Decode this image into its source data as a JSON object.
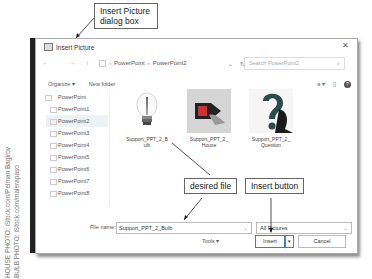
{
  "callouts": {
    "dialog": "Insert Picture dialog box",
    "desired_file": "desired file",
    "insert_button": "Insert button"
  },
  "credits": {
    "house": "HOUSE PHOTO: iStock.com/Pelman Bagirov",
    "bulb": "BULB PHOTO: iStock.com/malerapaso"
  },
  "dialog": {
    "title": "Insert Picture",
    "close": "✕",
    "nav": {
      "back": "←",
      "forward": "→",
      "up": "↑",
      "breadcrumb": [
        "PowerPoint",
        "PowerPoint2"
      ],
      "separator": "›",
      "refresh": "↻",
      "search_placeholder": "Search PowerPoint2",
      "search_icon": "⌕"
    },
    "toolbar": {
      "organize": "Organize ▾",
      "new_folder": "New folder",
      "view": "≡ ▾",
      "pane": "▯",
      "help": "?"
    },
    "sidebar": {
      "parent": "PowerPoint",
      "items": [
        "PowerPoint1",
        "PowerPoint2",
        "PowerPoint3",
        "PowerPoint4",
        "PowerPoint5",
        "PowerPoint6",
        "PowerPoint7",
        "PowerPoint8"
      ],
      "selected": "PowerPoint2",
      "scroll_down": "⌄"
    },
    "files": [
      {
        "name": "Support_PPT_2_Bulb",
        "label_line1": "Support_PPT_2_B",
        "label_line2": "ulb"
      },
      {
        "name": "Support_PPT_2_House",
        "label_line1": "Support_PPT_2_",
        "label_line2": "House"
      },
      {
        "name": "Support_PPT_2_Question",
        "label_line1": "Support_PPT_2_",
        "label_line2": "Question"
      }
    ],
    "bottom": {
      "file_name_label": "File name:",
      "file_name_value": "Support_PPT_2_Bulb",
      "filter_value": "All Pictures",
      "dropdown_arrow": "⌄",
      "tools": "Tools  ▾",
      "insert": "Insert",
      "insert_dropdown": "▾",
      "cancel": "Cancel"
    }
  }
}
